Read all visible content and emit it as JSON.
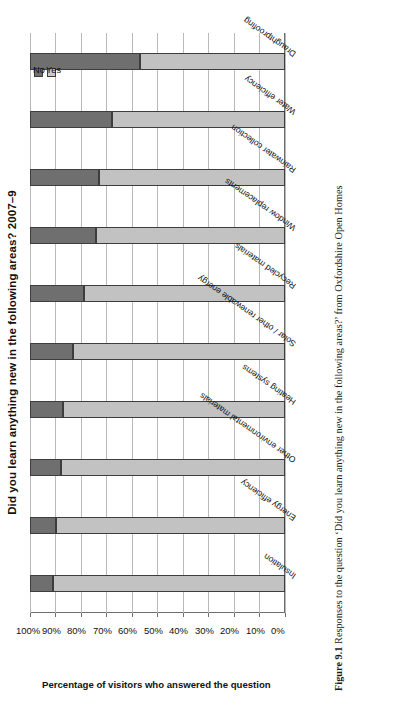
{
  "figure": {
    "title": "Did you learn anything new in the following areas? 2007–9",
    "caption_number": "Figure 9.1",
    "caption_text": "Responses to the question ‘Did you learn anything new in the following areas?’ from Oxfordshire Open Homes"
  },
  "legend": {
    "position": "top-right",
    "entries": [
      {
        "label": "No",
        "color": "#6f6f6f"
      },
      {
        "label": "Yes",
        "color": "#c9c9c9"
      }
    ]
  },
  "axes": {
    "y_title": "Percentage of visitors who answered the question",
    "tick_labels": [
      "0%",
      "10%",
      "20%",
      "30%",
      "40%",
      "50%",
      "60%",
      "70%",
      "80%",
      "90%",
      "100%"
    ]
  },
  "colors": {
    "yes": "#c2c2c2",
    "no": "#6f6f6f",
    "grid": "#b9b9b9",
    "axis": "#6d6d6d",
    "text": "#111111"
  },
  "chart_data": {
    "type": "bar",
    "orientation": "vertical-stacked-100",
    "title": "Did you learn anything new in the following areas? 2007–9",
    "xlabel": "",
    "ylabel": "Percentage of visitors who answered the question",
    "ylim": [
      0,
      100
    ],
    "grid": true,
    "legend_position": "top-right",
    "categories": [
      "Insulation",
      "Energy efficiency",
      "Other environmental materials",
      "Heating systems",
      "Solar / other renewable energy",
      "Recycled materials",
      "Window replacements",
      "Rainwater collection",
      "Water efficiency",
      "Draughtproofing"
    ],
    "series": [
      {
        "name": "Yes",
        "color": "#c2c2c2",
        "values": [
          91,
          90,
          88,
          87,
          83,
          79,
          74,
          73,
          68,
          57
        ]
      },
      {
        "name": "No",
        "color": "#6f6f6f",
        "values": [
          9,
          10,
          12,
          13,
          17,
          21,
          26,
          27,
          32,
          43
        ]
      }
    ]
  }
}
